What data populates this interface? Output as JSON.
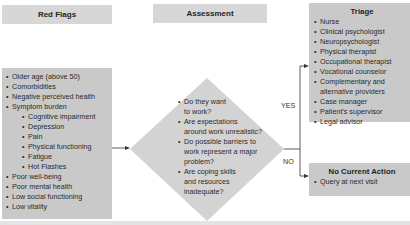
{
  "headers": {
    "red_flags": "Red Flags",
    "assessment": "Assessment"
  },
  "red_flags": {
    "items": [
      {
        "text": "Older age (above 50)",
        "level": 0
      },
      {
        "text": "Comorbidities",
        "level": 0
      },
      {
        "text": "Negative perceived health",
        "level": 0
      },
      {
        "text": "Symptom burden",
        "level": 0
      },
      {
        "text": "Cognitive impairment",
        "level": 1
      },
      {
        "text": "Depression",
        "level": 1
      },
      {
        "text": "Pain",
        "level": 1
      },
      {
        "text": "Physical functioning",
        "level": 1
      },
      {
        "text": "Fatigue",
        "level": 1
      },
      {
        "text": "Hot Flashes",
        "level": 1
      },
      {
        "text": "Poor well-being",
        "level": 0
      },
      {
        "text": "Poor mental health",
        "level": 0
      },
      {
        "text": "Low social functioning",
        "level": 0
      },
      {
        "text": "Low vitality",
        "level": 0
      }
    ]
  },
  "assessment": {
    "questions": [
      {
        "line1": "Do they want",
        "line2": "to work?"
      },
      {
        "line1": "Are expectations",
        "line2": "around work unrealistic?"
      },
      {
        "line1": "Do possible barriers to",
        "line2": "work represent a major",
        "line3": "problem?"
      },
      {
        "line1": "Are coping skills",
        "line2": "and resources",
        "line3": "inadequate?"
      }
    ]
  },
  "branches": {
    "yes": "YES",
    "no": "NO"
  },
  "triage": {
    "title": "Triage",
    "items": [
      "Nurse",
      "Clinical psychologist",
      "Neuropsychologist",
      "Physical therapist",
      "Occupational therapist",
      "Vocational counselor",
      "Complementary and",
      "alternative providers",
      "Case manager",
      "Patient's supervisor",
      "Legal advisor"
    ]
  },
  "no_action": {
    "title": "No Current Action",
    "items": [
      "Query at next visit"
    ]
  },
  "colors": {
    "header_fill": "#d7d7d7",
    "box_fill": "#c9c9c9",
    "diamond_fill": "#d3d3d3",
    "line": "#333333"
  }
}
